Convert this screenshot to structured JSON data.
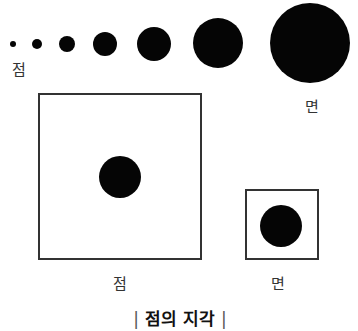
{
  "diagram": {
    "caption": {
      "left_bar": "|",
      "text": "점의 지각",
      "right_bar": "|"
    },
    "top_row": {
      "dots": [
        {
          "cx": 13,
          "cy": 44,
          "r": 3
        },
        {
          "cx": 37,
          "cy": 44,
          "r": 5
        },
        {
          "cx": 67,
          "cy": 44,
          "r": 8
        },
        {
          "cx": 105,
          "cy": 44,
          "r": 12
        },
        {
          "cx": 154,
          "cy": 44,
          "r": 17
        },
        {
          "cx": 218,
          "cy": 43,
          "r": 25
        },
        {
          "cx": 310,
          "cy": 43,
          "r": 40
        }
      ],
      "label_start": "점",
      "label_end": "면"
    },
    "comparison": {
      "large_frame": {
        "x": 38,
        "y": 93,
        "w": 164,
        "h": 167,
        "dot": {
          "cx": 120,
          "cy": 177,
          "r": 21
        },
        "label": "점"
      },
      "small_frame": {
        "x": 245,
        "y": 189,
        "w": 74,
        "h": 71,
        "dot": {
          "cx": 281,
          "cy": 226,
          "r": 21
        },
        "label": "면"
      }
    },
    "colors": {
      "dot": "#050505",
      "frame": "#333333",
      "text": "#333333",
      "background": "#ffffff"
    }
  }
}
